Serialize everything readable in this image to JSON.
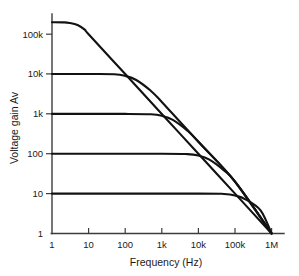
{
  "chart_data": {
    "type": "line",
    "title": "",
    "xlabel": "Frequency (Hz)",
    "ylabel": "Voltage gain Av",
    "xscale": "log",
    "yscale": "log",
    "xlim": [
      1,
      1000000
    ],
    "ylim": [
      1,
      1000000
    ],
    "grid": false,
    "legend": "none",
    "x_tick_labels": [
      "1",
      "10",
      "100",
      "1k",
      "10k",
      "100k",
      "1M"
    ],
    "x_tick_values": [
      1,
      10,
      100,
      1000,
      10000,
      100000,
      1000000
    ],
    "y_tick_labels": [
      "1",
      "10",
      "100",
      "1k",
      "10k",
      "100k"
    ],
    "y_tick_values": [
      1,
      10,
      100,
      1000,
      10000,
      100000
    ],
    "annotation": "Gain-bandwidth product constant at 1 MHz; all closed-loop responses roll off at -20 dB/decade and converge at unity gain at 1 MHz.",
    "series": [
      {
        "name": "Open-loop gain",
        "plateau_gain": 200000,
        "breakpoint_hz": 5,
        "unity_gain_hz": 1000000,
        "points": [
          {
            "f": 1,
            "av": 200000
          },
          {
            "f": 2,
            "av": 198000
          },
          {
            "f": 3,
            "av": 192000
          },
          {
            "f": 5,
            "av": 170000
          },
          {
            "f": 8,
            "av": 128000
          },
          {
            "f": 10,
            "av": 100000
          },
          {
            "f": 100,
            "av": 10000
          },
          {
            "f": 1000,
            "av": 1000
          },
          {
            "f": 10000,
            "av": 100
          },
          {
            "f": 100000,
            "av": 10
          },
          {
            "f": 1000000,
            "av": 1
          }
        ]
      },
      {
        "name": "Closed-loop gain 10k",
        "plateau_gain": 10000,
        "breakpoint_hz": 100,
        "unity_gain_hz": 1000000,
        "points": [
          {
            "f": 1,
            "av": 10000
          },
          {
            "f": 10,
            "av": 10000
          },
          {
            "f": 50,
            "av": 9890
          },
          {
            "f": 100,
            "av": 9000
          },
          {
            "f": 200,
            "av": 7100
          },
          {
            "f": 500,
            "av": 3800
          },
          {
            "f": 1000,
            "av": 2000
          },
          {
            "f": 10000,
            "av": 200
          },
          {
            "f": 100000,
            "av": 20
          },
          {
            "f": 1000000,
            "av": 1
          }
        ]
      },
      {
        "name": "Closed-loop gain 1k",
        "plateau_gain": 1000,
        "breakpoint_hz": 1000,
        "unity_gain_hz": 1000000,
        "points": [
          {
            "f": 1,
            "av": 1000
          },
          {
            "f": 100,
            "av": 1000
          },
          {
            "f": 500,
            "av": 980
          },
          {
            "f": 1000,
            "av": 900
          },
          {
            "f": 2000,
            "av": 710
          },
          {
            "f": 5000,
            "av": 380
          },
          {
            "f": 10000,
            "av": 200
          },
          {
            "f": 100000,
            "av": 20
          },
          {
            "f": 1000000,
            "av": 1
          }
        ]
      },
      {
        "name": "Closed-loop gain 100",
        "plateau_gain": 100,
        "breakpoint_hz": 10000,
        "unity_gain_hz": 1000000,
        "points": [
          {
            "f": 1,
            "av": 100
          },
          {
            "f": 1000,
            "av": 100
          },
          {
            "f": 5000,
            "av": 98
          },
          {
            "f": 10000,
            "av": 90
          },
          {
            "f": 20000,
            "av": 71
          },
          {
            "f": 50000,
            "av": 38
          },
          {
            "f": 100000,
            "av": 20
          },
          {
            "f": 1000000,
            "av": 1
          }
        ]
      },
      {
        "name": "Closed-loop gain 10",
        "plateau_gain": 10,
        "breakpoint_hz": 100000,
        "unity_gain_hz": 1000000,
        "points": [
          {
            "f": 1,
            "av": 10
          },
          {
            "f": 10000,
            "av": 10
          },
          {
            "f": 50000,
            "av": 9.8
          },
          {
            "f": 100000,
            "av": 9.0
          },
          {
            "f": 200000,
            "av": 7.1
          },
          {
            "f": 500000,
            "av": 3.8
          },
          {
            "f": 1000000,
            "av": 1
          }
        ]
      }
    ]
  },
  "colors": {
    "curve": "#121212",
    "axis": "#3c3c3c",
    "text": "#1a1a1a",
    "background": "#ffffff"
  }
}
